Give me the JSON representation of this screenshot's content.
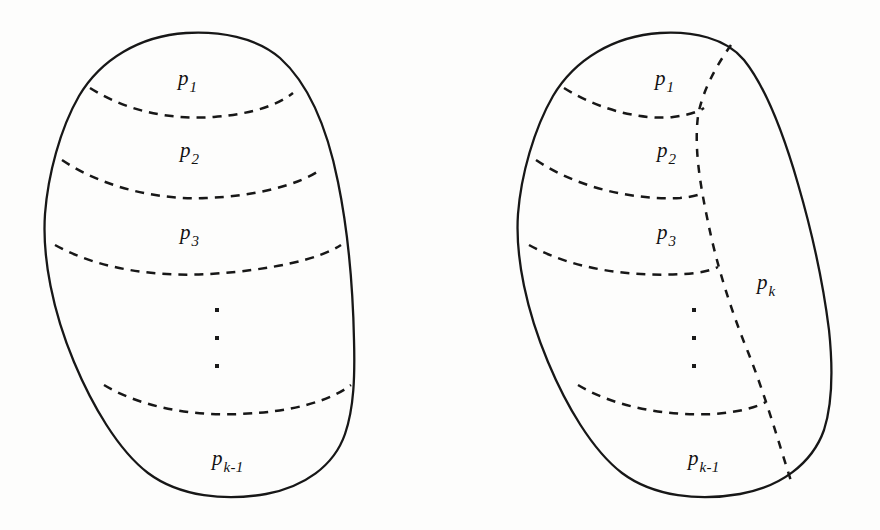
{
  "figure": {
    "background_color": "#fdfdfc",
    "ink_color": "#171717",
    "shapes": [
      {
        "name": "left-blob",
        "caption": "Set partitioned into k-1 horizontal strips"
      },
      {
        "name": "right-blob",
        "caption": "Set partitioned into k regions with vertical cut"
      }
    ]
  },
  "left_diagram": {
    "name": "left-partition-diagram",
    "labels": [
      {
        "id": "p1",
        "base": "p",
        "sub": "1",
        "x": 178,
        "y": 68
      },
      {
        "id": "p2",
        "base": "p",
        "sub": "2",
        "x": 180,
        "y": 140
      },
      {
        "id": "p3",
        "base": "p",
        "sub": "3",
        "x": 180,
        "y": 222
      },
      {
        "id": "pk-1",
        "base": "p",
        "sub": "k-1",
        "x": 212,
        "y": 448
      }
    ],
    "ellipsis": {
      "id": "left-vertical-dots",
      "x": 215,
      "y": 308,
      "count": 3
    },
    "arc_count": 4
  },
  "right_diagram": {
    "name": "right-partition-diagram",
    "labels": [
      {
        "id": "p1",
        "base": "p",
        "sub": "1",
        "x": 655,
        "y": 68
      },
      {
        "id": "p2",
        "base": "p",
        "sub": "2",
        "x": 657,
        "y": 140
      },
      {
        "id": "p3",
        "base": "p",
        "sub": "3",
        "x": 657,
        "y": 222
      },
      {
        "id": "pk",
        "base": "p",
        "sub": "k",
        "x": 757,
        "y": 272
      },
      {
        "id": "pk-1",
        "base": "p",
        "sub": "k-1",
        "x": 688,
        "y": 448
      }
    ],
    "ellipsis": {
      "id": "right-vertical-dots",
      "x": 692,
      "y": 308,
      "count": 3
    },
    "arc_count": 4,
    "cut_name": "vertical-dashed-cut"
  }
}
